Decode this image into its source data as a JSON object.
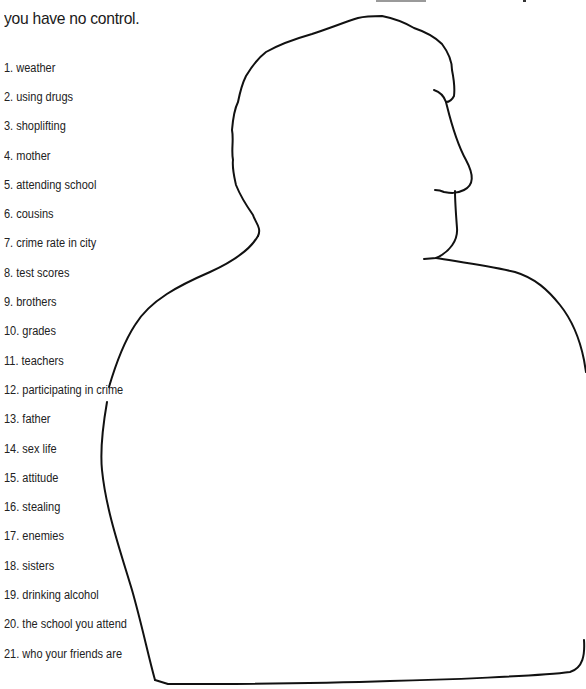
{
  "header": {
    "line1_fragment": "only you have control and which items you",
    "line2": "you have no control.",
    "underlined_word_color": "#9a9a9a"
  },
  "figure": {
    "type": "head-and-shoulders silhouette outline (profile facing right)",
    "stroke_color": "#111111"
  },
  "items": [
    {
      "number": "1.",
      "label": "weather",
      "text": "1. weather"
    },
    {
      "number": "2.",
      "label": "using drugs",
      "text": "2. using drugs"
    },
    {
      "number": "3.",
      "label": "shoplifting",
      "text": "3.  shoplifting"
    },
    {
      "number": "4.",
      "label": "mother",
      "text": "4.  mother"
    },
    {
      "number": "5.",
      "label": "attending school",
      "text": "5. attending school"
    },
    {
      "number": "6.",
      "label": "cousins",
      "text": "6. cousins"
    },
    {
      "number": "7.",
      "label": "crime rate in city",
      "text": "7. crime rate in city"
    },
    {
      "number": "8.",
      "label": "test scores",
      "text": "8.  test scores"
    },
    {
      "number": "9.",
      "label": "brothers",
      "text": "9.  brothers"
    },
    {
      "number": "10.",
      "label": "grades",
      "text": "10. grades"
    },
    {
      "number": "11.",
      "label": "teachers",
      "text": "11. teachers"
    },
    {
      "number": "12.",
      "label": "participating in crime",
      "text": "12. participating in crime"
    },
    {
      "number": "13.",
      "label": "father",
      "text": "13.  father"
    },
    {
      "number": "14.",
      "label": "sex life",
      "text": "14. sex life"
    },
    {
      "number": "15.",
      "label": "attitude",
      "text": "15.  attitude"
    },
    {
      "number": "16.",
      "label": "stealing",
      "text": "16. stealing"
    },
    {
      "number": "17.",
      "label": "enemies",
      "text": "17. enemies"
    },
    {
      "number": "18.",
      "label": "sisters",
      "text": "18.  sisters"
    },
    {
      "number": "19.",
      "label": "drinking alcohol",
      "text": "19. drinking alcohol"
    },
    {
      "number": "20.",
      "label": "the school you attend",
      "text": "20. the school you attend"
    },
    {
      "number": "21.",
      "label": "who your friends are",
      "text": "21. who your friends are"
    }
  ]
}
